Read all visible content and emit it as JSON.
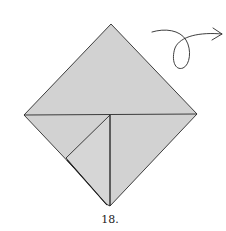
{
  "diagram": {
    "step_number": "18.",
    "paper_color": "#d2d2d2",
    "line_color": "#2a2a2a",
    "shape": "square-base (diamond) with folded flap at lower-left",
    "instruction_symbol": "turn-over-arrow",
    "icons": {
      "turn_over": "loop-arrow-icon"
    }
  }
}
